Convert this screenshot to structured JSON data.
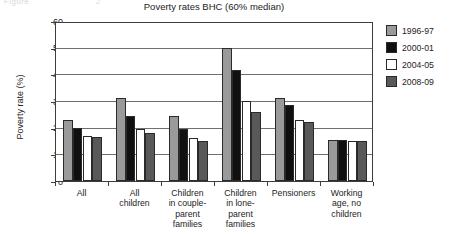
{
  "top_cut_text": [
    {
      "text": "Figure",
      "left": 4
    },
    {
      "text": "2",
      "left": 96
    }
  ],
  "chart_data": {
    "type": "bar",
    "title": "Poverty rates BHC (60% median)",
    "xlabel": "",
    "ylabel": "Poverty rate (%)",
    "ylim": [
      0,
      60
    ],
    "ytick_labels": [
      "0",
      "10",
      "20",
      "30",
      "40",
      "50",
      "60"
    ],
    "ytick_values": [
      0,
      10,
      20,
      30,
      40,
      50,
      60
    ],
    "grid": true,
    "legend_position": "right",
    "categories": [
      "All",
      "All children",
      "Children in couple-parent families",
      "Children in lone-parent families",
      "Pensioners",
      "Working age, no children"
    ],
    "category_label_lines": [
      [
        "All"
      ],
      [
        "All",
        "children"
      ],
      [
        "Children",
        "in couple-",
        "parent",
        "families"
      ],
      [
        "Children",
        "in lone-",
        "parent",
        "families"
      ],
      [
        "Pensioners"
      ],
      [
        "Working",
        "age, no",
        "children"
      ]
    ],
    "series": [
      {
        "name": "1996-97",
        "color": "#9a9a9a",
        "values": [
          23,
          31,
          24.5,
          50,
          31,
          15.5
        ]
      },
      {
        "name": "2000-01",
        "color": "#101010",
        "values": [
          20,
          24.5,
          19.5,
          41.5,
          28.5,
          15.5
        ]
      },
      {
        "name": "2004-05",
        "color": "#ffffff",
        "values": [
          17,
          19.5,
          16,
          30,
          23,
          15
        ]
      },
      {
        "name": "2008-09",
        "color": "#595959",
        "values": [
          16.5,
          18,
          15,
          26,
          22,
          15
        ]
      }
    ]
  }
}
